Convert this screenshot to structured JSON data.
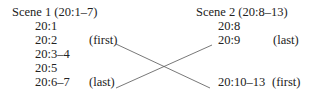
{
  "scene1": {
    "title": "Scene 1 (20:1–7)",
    "verses": [
      {
        "ref": "20:1",
        "note": ""
      },
      {
        "ref": "20:2",
        "note": "(first)"
      },
      {
        "ref": "20:3–4",
        "note": ""
      },
      {
        "ref": "20:5",
        "note": ""
      },
      {
        "ref": "20:6–7",
        "note": "(last)"
      }
    ]
  },
  "scene2": {
    "title": "Scene 2 (20:8–13)",
    "verses": [
      {
        "ref": "20:8",
        "note": ""
      },
      {
        "ref": "20:9",
        "note": "(last)"
      },
      {
        "ref": "20:10–13",
        "note": "(first)"
      }
    ]
  },
  "connections": [
    {
      "from": "scene1 20:2 (first)",
      "to": "scene2 20:10–13 (first)"
    },
    {
      "from": "scene1 20:6–7 (last)",
      "to": "scene2 20:9 (last)"
    }
  ],
  "colors": {
    "text": "#222222",
    "line": "#555555"
  }
}
